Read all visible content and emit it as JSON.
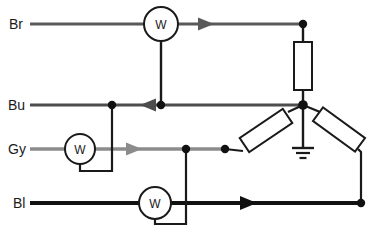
{
  "diagram": {
    "type": "electrical-circuit",
    "width": 383,
    "height": 233,
    "background_color": "#ffffff"
  },
  "colors": {
    "brown_wire": "#595959",
    "blue_wire": "#4d4d4d",
    "grey_wire": "#8c8c8c",
    "black_wire": "#111111",
    "outline": "#1a1a1a",
    "node_fill": "#111111",
    "text": "#1a1a1a"
  },
  "wires": [
    {
      "id": "br",
      "label": "Br",
      "name": "brown",
      "y": 24,
      "color": "#595959",
      "thickness": 3.2,
      "label_x": 10,
      "label_y": 29,
      "x_start": 30,
      "x_end": 303,
      "arrow_direction": "right",
      "arrow_x": 206
    },
    {
      "id": "bu",
      "label": "Bu",
      "name": "blue",
      "y": 105,
      "color": "#4d4d4d",
      "thickness": 3.2,
      "label_x": 9,
      "label_y": 110,
      "x_start": 30,
      "x_end": 303,
      "arrow_direction": "left",
      "arrow_x": 148
    },
    {
      "id": "gy",
      "label": "Gy",
      "name": "grey",
      "y": 149,
      "color": "#8c8c8c",
      "thickness": 3.2,
      "label_x": 9,
      "label_y": 154,
      "x_start": 30,
      "x_end": 225,
      "arrow_direction": "right",
      "arrow_x": 133
    },
    {
      "id": "bl",
      "label": "Bl",
      "name": "black",
      "y": 203,
      "color": "#111111",
      "thickness": 4.0,
      "label_x": 14,
      "label_y": 208,
      "x_start": 30,
      "x_end": 361,
      "arrow_direction": "right",
      "arrow_x": 248
    }
  ],
  "meters": [
    {
      "id": "meter-br",
      "label": "W",
      "cx": 161,
      "cy": 24,
      "r": 17,
      "on_wire": "br",
      "stem_to_y": 105,
      "loop": false
    },
    {
      "id": "meter-gy",
      "label": "W",
      "cx": 80,
      "cy": 149,
      "r": 15,
      "on_wire": "gy",
      "loop": true,
      "loop_bottom_y": 171,
      "loop_right_x": 112,
      "loop_up_to_y": 105
    },
    {
      "id": "meter-bl",
      "label": "W",
      "cx": 155,
      "cy": 203,
      "r": 16,
      "on_wire": "bl",
      "loop": true,
      "loop_bottom_y": 224,
      "loop_right_x": 186,
      "loop_up_to_y": 149
    }
  ],
  "resistors": [
    {
      "id": "resistor-vertical",
      "orientation": "vertical",
      "x": 303,
      "y_top": 42,
      "y_bottom": 90,
      "width": 18,
      "connects": [
        "br-right-node",
        "center-node"
      ]
    },
    {
      "id": "resistor-left-angled",
      "orientation": "angled-up-right",
      "x1": 240,
      "y1": 153,
      "x2": 297,
      "y2": 110,
      "width": 17,
      "connects": [
        "gy-right-node",
        "center-node"
      ]
    },
    {
      "id": "resistor-right-angled",
      "orientation": "angled-down-right",
      "x1": 310,
      "y1": 110,
      "x2": 360,
      "y2": 152,
      "width": 17,
      "connects": [
        "center-node",
        "bl-right-node"
      ]
    }
  ],
  "ground": {
    "id": "ground-symbol",
    "x": 303,
    "y_from": 105,
    "y_to": 148,
    "bars": [
      22,
      14,
      7
    ],
    "bar_spacing": 5
  },
  "nodes": [
    {
      "id": "br-right-node",
      "x": 303,
      "y": 24,
      "r": 4.2
    },
    {
      "id": "center-node",
      "x": 303,
      "y": 105,
      "r": 4.8
    },
    {
      "id": "bu-meter-node",
      "x": 161,
      "y": 105,
      "r": 4.2
    },
    {
      "id": "bu-loop-node",
      "x": 112,
      "y": 105,
      "r": 4.2
    },
    {
      "id": "gy-resistor-node",
      "x": 225,
      "y": 149,
      "r": 4.2
    },
    {
      "id": "gy-bl-node",
      "x": 186,
      "y": 149,
      "r": 4.2
    },
    {
      "id": "bl-right-node",
      "x": 361,
      "y": 203,
      "r": 4.2
    }
  ]
}
